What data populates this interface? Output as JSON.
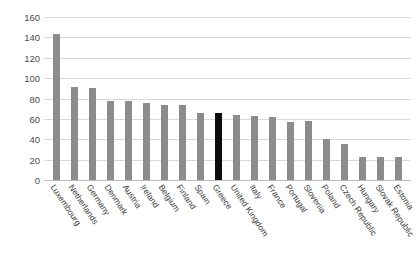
{
  "chart_data": {
    "type": "bar",
    "title": "",
    "subtitle": "",
    "xlabel": "",
    "ylabel": "",
    "ylim": [
      0,
      160
    ],
    "y_ticks": [
      0,
      20,
      40,
      60,
      80,
      100,
      120,
      140,
      160
    ],
    "grid": true,
    "legend": "none",
    "bar_color": "#8c8c8c",
    "highlight_color": "#0d0d0d",
    "highlight_category": "Greece",
    "categories": [
      "Luxembourg",
      "Netherlands",
      "Germany",
      "Denmark",
      "Austria",
      "Ireland",
      "Belgium",
      "Finland",
      "Spain",
      "Greece",
      "United Kingdom",
      "Italy",
      "France",
      "Portugal",
      "Slovenia",
      "Poland",
      "Czech Republic",
      "Hungary",
      "Slovak Republic",
      "Estonia"
    ],
    "values": [
      143,
      91,
      90,
      78,
      78,
      76,
      74,
      74,
      66,
      66,
      64,
      63,
      62,
      57,
      58,
      40,
      35,
      23,
      23,
      23
    ]
  }
}
